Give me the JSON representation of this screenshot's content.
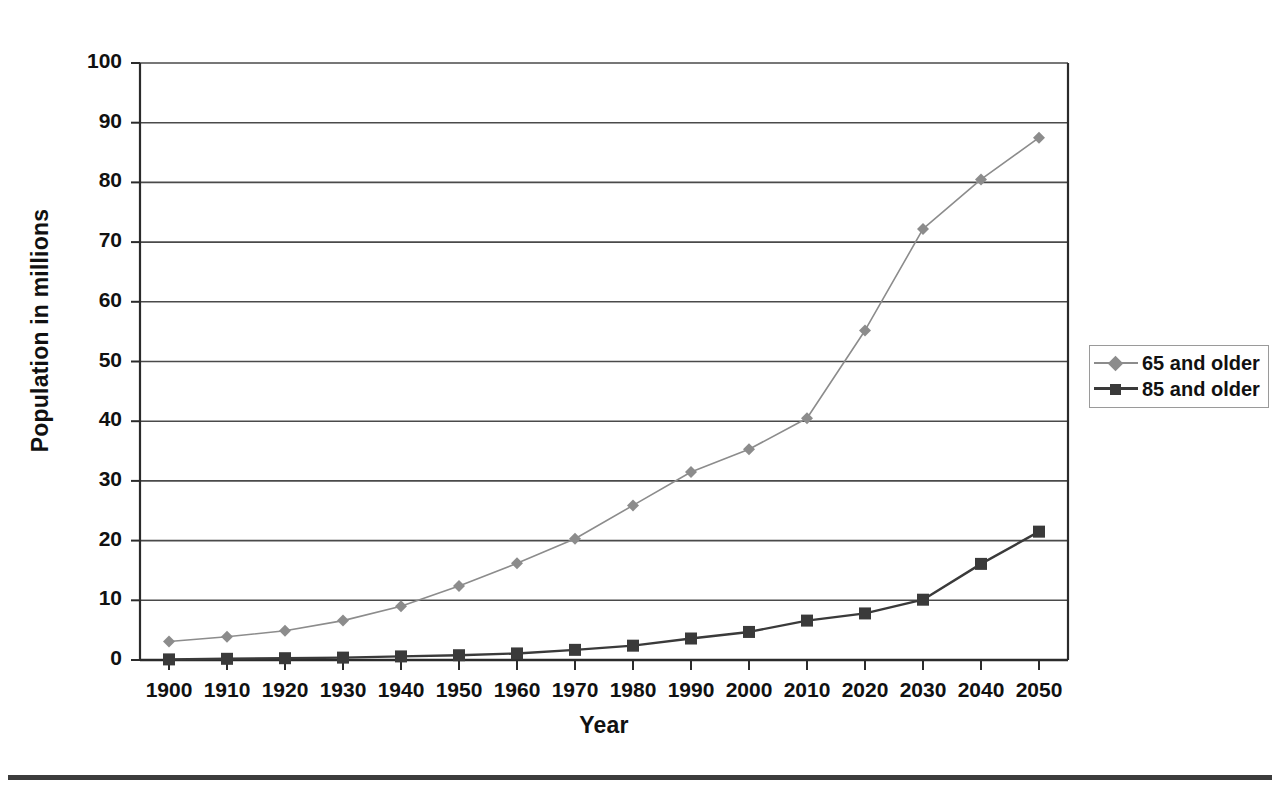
{
  "chart_data": {
    "type": "line",
    "title": "",
    "xlabel": "Year",
    "ylabel": "Population in millions",
    "x": [
      1900,
      1910,
      1920,
      1930,
      1940,
      1950,
      1960,
      1970,
      1980,
      1990,
      2000,
      2010,
      2020,
      2030,
      2040,
      2050
    ],
    "xtick_labels": [
      "1900",
      "1910",
      "1920",
      "1930",
      "1940",
      "1950",
      "1960",
      "1970",
      "1980",
      "1990",
      "2000",
      "2010",
      "2020",
      "2030",
      "2040",
      "2050"
    ],
    "ytick_labels": [
      "0",
      "10",
      "20",
      "30",
      "40",
      "50",
      "60",
      "70",
      "80",
      "90",
      "100"
    ],
    "ylim": [
      0,
      100
    ],
    "xlim": [
      1900,
      2050
    ],
    "grid": "horizontal",
    "legend_position": "right",
    "series": [
      {
        "name": "65 and older",
        "color": "#8c8c8c",
        "marker": "diamond",
        "values": [
          3.1,
          3.9,
          4.9,
          6.6,
          9.0,
          12.4,
          16.2,
          20.3,
          25.9,
          31.5,
          35.3,
          40.5,
          55.2,
          72.2,
          80.5,
          87.5
        ]
      },
      {
        "name": "85 and older",
        "color": "#3a3a3a",
        "marker": "square",
        "values": [
          0.1,
          0.2,
          0.3,
          0.4,
          0.6,
          0.8,
          1.1,
          1.7,
          2.4,
          3.6,
          4.7,
          6.6,
          7.8,
          10.1,
          16.1,
          21.5
        ]
      }
    ]
  },
  "legend": {
    "items": [
      {
        "label": "65 and older"
      },
      {
        "label": "85 and older"
      }
    ]
  },
  "colors": {
    "series_65": "#8c8c8c",
    "series_85": "#3a3a3a",
    "axis": "#2b2b2b",
    "grid": "#4a4a4a",
    "text": "#111111",
    "rule": "#3c3c3c"
  },
  "footer": {
    "caption_clipped": ""
  }
}
